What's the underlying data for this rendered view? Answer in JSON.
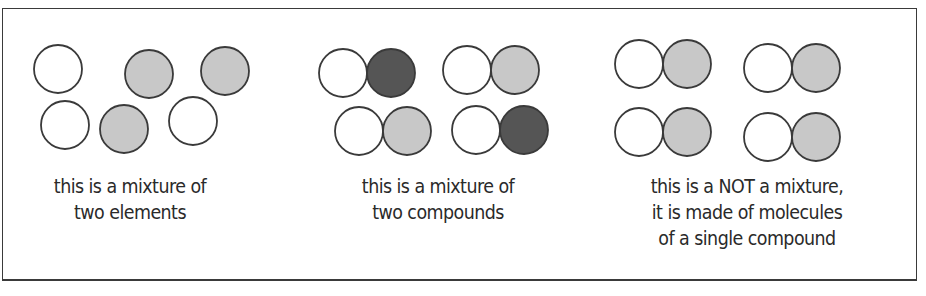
{
  "colors": {
    "white_atom": "#ffffff",
    "light_atom": "#c8c8c8",
    "dark_atom": "#555555",
    "outline": "#3a3a3a",
    "text": "#2a2a2a"
  },
  "panels": [
    {
      "name": "mixture-of-two-elements",
      "caption_lines": [
        "this is a mixture of",
        "two elements"
      ],
      "atoms": [
        {
          "cx": 58,
          "cy": 69,
          "fill": "white"
        },
        {
          "cx": 149,
          "cy": 74,
          "fill": "light"
        },
        {
          "cx": 225,
          "cy": 71,
          "fill": "light"
        },
        {
          "cx": 65,
          "cy": 125,
          "fill": "white"
        },
        {
          "cx": 124,
          "cy": 129,
          "fill": "light"
        },
        {
          "cx": 193,
          "cy": 121,
          "fill": "white"
        }
      ]
    },
    {
      "name": "mixture-of-two-compounds",
      "caption_lines": [
        "this is a mixture of",
        "two compounds"
      ],
      "molecules": [
        {
          "x": 343,
          "y": 73,
          "atoms": [
            "white",
            "dark"
          ]
        },
        {
          "x": 467,
          "y": 70,
          "atoms": [
            "white",
            "light"
          ]
        },
        {
          "x": 359,
          "y": 131,
          "atoms": [
            "white",
            "light"
          ]
        },
        {
          "x": 476,
          "y": 130,
          "atoms": [
            "white",
            "dark"
          ]
        }
      ]
    },
    {
      "name": "single-compound",
      "caption_lines": [
        "this is a NOT a mixture,",
        "it is made of molecules",
        "of a single compound"
      ],
      "molecules": [
        {
          "x": 639,
          "y": 64,
          "atoms": [
            "white",
            "light"
          ]
        },
        {
          "x": 768,
          "y": 68,
          "atoms": [
            "white",
            "light"
          ]
        },
        {
          "x": 639,
          "y": 132,
          "atoms": [
            "white",
            "light"
          ]
        },
        {
          "x": 768,
          "y": 137,
          "atoms": [
            "white",
            "light"
          ]
        }
      ]
    }
  ],
  "atom_radius": 24,
  "bond_offset": 48
}
